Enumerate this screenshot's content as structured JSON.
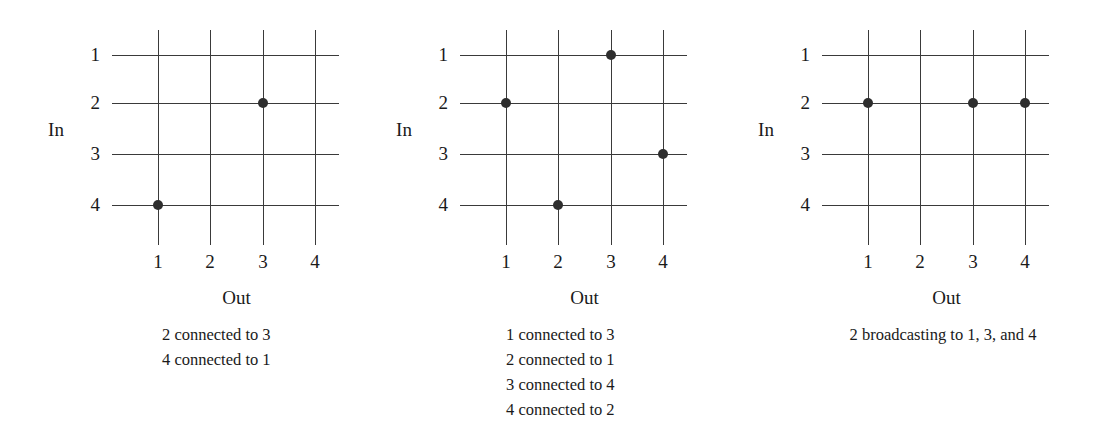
{
  "figure": {
    "axis_labels": {
      "in": "In",
      "out": "Out"
    },
    "row_ticks": [
      "1",
      "2",
      "3",
      "4"
    ],
    "col_ticks": [
      "1",
      "2",
      "3",
      "4"
    ],
    "line_color": "#3a3a3a",
    "dot_color": "#2e2e2e",
    "background": "#ffffff"
  },
  "panels": [
    {
      "id": "panel-1",
      "in_label": "In",
      "out_label": "Out",
      "row_ticks": [
        "1",
        "2",
        "3",
        "4"
      ],
      "col_ticks": [
        "1",
        "2",
        "3",
        "4"
      ],
      "connections": [
        {
          "in": 2,
          "out": 3
        },
        {
          "in": 4,
          "out": 1
        }
      ],
      "caption_lines": [
        "2 connected to 3",
        "4 connected to 1"
      ]
    },
    {
      "id": "panel-2",
      "in_label": "In",
      "out_label": "Out",
      "row_ticks": [
        "1",
        "2",
        "3",
        "4"
      ],
      "col_ticks": [
        "1",
        "2",
        "3",
        "4"
      ],
      "connections": [
        {
          "in": 1,
          "out": 3
        },
        {
          "in": 2,
          "out": 1
        },
        {
          "in": 3,
          "out": 4
        },
        {
          "in": 4,
          "out": 2
        }
      ],
      "caption_lines": [
        "1 connected to 3",
        "2 connected to 1",
        "3 connected to 4",
        "4 connected to 2"
      ]
    },
    {
      "id": "panel-3",
      "in_label": "In",
      "out_label": "Out",
      "row_ticks": [
        "1",
        "2",
        "3",
        "4"
      ],
      "col_ticks": [
        "1",
        "2",
        "3",
        "4"
      ],
      "connections": [
        {
          "in": 2,
          "out": 1
        },
        {
          "in": 2,
          "out": 3
        },
        {
          "in": 2,
          "out": 4
        }
      ],
      "caption_lines": [
        "2 broadcasting to 1, 3, and 4"
      ]
    }
  ],
  "chart_data": {
    "type": "diagram",
    "xlabel": "Out",
    "ylabel": "In",
    "x_ticks": [
      "1",
      "2",
      "3",
      "4"
    ],
    "y_ticks": [
      "1",
      "2",
      "3",
      "4"
    ],
    "panels": [
      {
        "name": "2 connected to 3 / 4 connected to 1",
        "points": [
          [
            3,
            2
          ],
          [
            1,
            4
          ]
        ]
      },
      {
        "name": "1 connected to 3 / 2 connected to 1 / 3 connected to 4 / 4 connected to 2",
        "points": [
          [
            3,
            1
          ],
          [
            1,
            2
          ],
          [
            4,
            3
          ],
          [
            2,
            4
          ]
        ]
      },
      {
        "name": "2 broadcasting to 1, 3, and 4",
        "points": [
          [
            1,
            2
          ],
          [
            3,
            2
          ],
          [
            4,
            2
          ]
        ]
      }
    ]
  }
}
